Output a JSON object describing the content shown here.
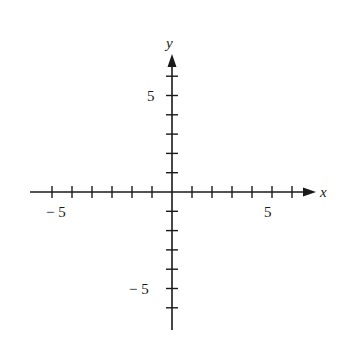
{
  "chart_data": {
    "type": "diagram",
    "title": "",
    "xlabel": "x",
    "ylabel": "y",
    "xlim": [
      -7,
      7
    ],
    "ylim": [
      -7,
      7
    ],
    "x_ticks": [
      -6,
      -5,
      -4,
      -3,
      -2,
      -1,
      1,
      2,
      3,
      4,
      5,
      6
    ],
    "y_ticks": [
      -6,
      -5,
      -4,
      -3,
      -2,
      -1,
      1,
      2,
      3,
      4,
      5,
      6
    ],
    "x_tick_labels": {
      "neg": "− 5",
      "pos": "5"
    },
    "y_tick_labels": {
      "neg": "− 5",
      "pos": "5"
    },
    "grid": false
  },
  "axes": {
    "x_label": "x",
    "y_label": "y",
    "x_neg_label": "− 5",
    "x_pos_label": "5",
    "y_pos_label": "5",
    "y_neg_label": "− 5"
  },
  "colors": {
    "ink": "#1a1a1a",
    "background": "#ffffff"
  }
}
